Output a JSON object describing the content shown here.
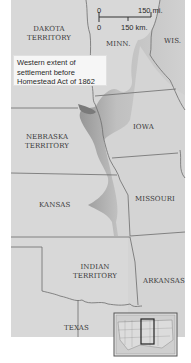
{
  "map": {
    "regions": [
      {
        "id": "dakota",
        "label_lines": [
          "DAKOTA",
          "TERRITORY"
        ]
      },
      {
        "id": "minn",
        "label_lines": [
          "MINN."
        ]
      },
      {
        "id": "wis",
        "label_lines": [
          "WIS."
        ]
      },
      {
        "id": "nebraska",
        "label_lines": [
          "NEBRASKA",
          "TERRITORY"
        ]
      },
      {
        "id": "iowa",
        "label_lines": [
          "IOWA"
        ]
      },
      {
        "id": "kansas",
        "label_lines": [
          "KANSAS"
        ]
      },
      {
        "id": "missouri",
        "label_lines": [
          "MISSOURI"
        ]
      },
      {
        "id": "indian",
        "label_lines": [
          "INDIAN",
          "TERRITORY"
        ]
      },
      {
        "id": "arkansas",
        "label_lines": [
          "ARKANSAS"
        ]
      },
      {
        "id": "texas",
        "label_lines": [
          "TEXAS"
        ]
      }
    ],
    "legend": {
      "text": "Western extent of settlement before Homestead Act of 1862",
      "lines": [
        "Western extent of",
        "settlement before",
        "Homestead Act of 1862"
      ]
    },
    "scale": {
      "mi_zero": "0",
      "mi_label": "150 mi.",
      "km_zero": "0",
      "km_label": "150 km."
    },
    "colors": {
      "land": "#d6d6d6",
      "settled": "#a9a9a9",
      "border": "#707070",
      "background": "#ffffff"
    },
    "inset": {
      "description": "locator map of United States with highlighted region"
    }
  }
}
